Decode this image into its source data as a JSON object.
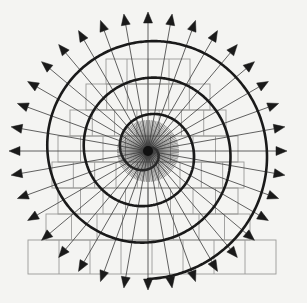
{
  "figure": {
    "type": "geometric-diagram",
    "caption": "",
    "canvas": {
      "width": 307,
      "height": 303,
      "background": "#f4f4f2"
    },
    "center": {
      "x": 148,
      "y": 151
    },
    "colors": {
      "spiral_stroke": "#1a1a1a",
      "spoke_stroke": "#3a3a3a",
      "grid_stroke": "#9a9a98",
      "arrow_fill": "#1a1a1a",
      "hub_fill": "#111111",
      "background": "#f4f4f2"
    },
    "stroke_widths": {
      "spiral": 2.6,
      "spoke": 0.8,
      "grid": 0.9
    }
  },
  "chart_data": {
    "type": "line",
    "xlabel": "",
    "ylabel": "",
    "grid": true,
    "legend_position": "none",
    "polar": {
      "center_x": 148,
      "center_y": 151,
      "spiral_model": "r = a * theta",
      "a": 2.04,
      "theta_start_deg": 0,
      "theta_end_deg": 1260,
      "turns": 3.5,
      "r_max": 128,
      "turn_radii": [
        9,
        27,
        60,
        95,
        128
      ],
      "hub_radius": 5
    },
    "spokes": {
      "count": 36,
      "angle_step_deg": 10,
      "angle_start_deg": -90,
      "inner_radius": 0,
      "outer_radius": 128,
      "arrow_length": 11,
      "arrow_width": 9,
      "arrow_tip_radius": 139
    },
    "grid_rows": [
      {
        "y_top": 59,
        "y_bottom": 84,
        "x_left": 106,
        "x_right": 190,
        "cells": 4
      },
      {
        "y_top": 84,
        "y_bottom": 110,
        "x_left": 86,
        "x_right": 210,
        "cells": 6
      },
      {
        "y_top": 110,
        "y_bottom": 136,
        "x_left": 70,
        "x_right": 226,
        "cells": 7
      },
      {
        "y_top": 136,
        "y_bottom": 162,
        "x_left": 58,
        "x_right": 238,
        "cells": 8
      },
      {
        "y_top": 162,
        "y_bottom": 188,
        "x_left": 52,
        "x_right": 244,
        "cells": 9
      },
      {
        "y_top": 188,
        "y_bottom": 214,
        "x_left": 58,
        "x_right": 238,
        "cells": 8
      },
      {
        "y_top": 214,
        "y_bottom": 240,
        "x_left": 46,
        "x_right": 250,
        "cells": 8
      },
      {
        "y_top": 240,
        "y_bottom": 274,
        "x_left": 28,
        "x_right": 276,
        "cells": 8
      }
    ],
    "series": [
      {
        "name": "spiral",
        "description": "continuous Archimedean spiral sampled every 3 degrees",
        "values": [
          9,
          128
        ]
      }
    ]
  }
}
